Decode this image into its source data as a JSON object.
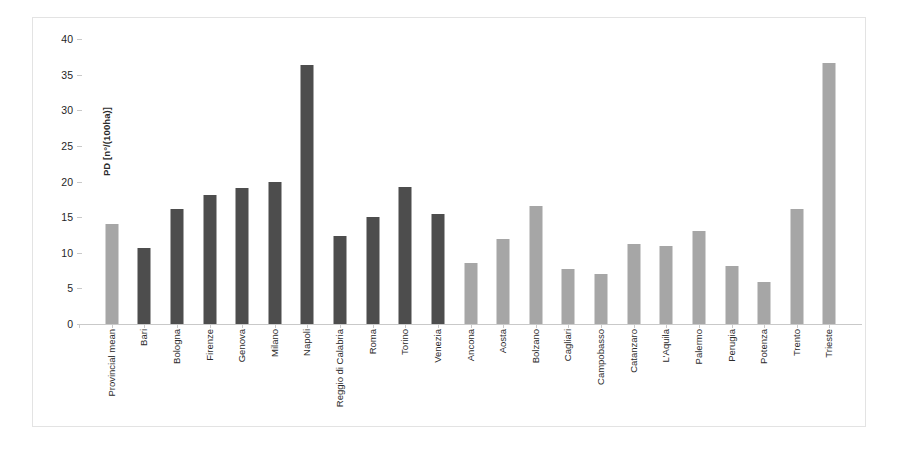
{
  "chart_data": {
    "type": "bar",
    "title": "",
    "xlabel": "",
    "ylabel": "PD [n°/(100ha)]",
    "ylim": [
      0,
      40
    ],
    "ytick_step": 5,
    "ytick_labels": [
      "40",
      "35",
      "30",
      "25",
      "20",
      "15",
      "10",
      "5",
      "0"
    ],
    "yticks": [
      40,
      35,
      30,
      25,
      20,
      15,
      10,
      5,
      0
    ],
    "grid": false,
    "legend": "none",
    "categories": [
      "Provincial mean",
      "Bari",
      "Bologna",
      "Firenze",
      "Genova",
      "Milano",
      "Napoli",
      "Reggio di Calabria",
      "Roma",
      "Torino",
      "Venezia",
      "Ancona",
      "Aosta",
      "Bolzano",
      "Cagliari",
      "Campobasso",
      "Catanzaro",
      "L'Aquila",
      "Palermo",
      "Perugia",
      "Potenza",
      "Trento",
      "Trieste"
    ],
    "values": [
      14.0,
      10.7,
      16.1,
      18.1,
      19.1,
      19.9,
      36.4,
      12.3,
      15.0,
      19.3,
      15.4,
      8.5,
      12.0,
      16.6,
      7.7,
      7.0,
      11.2,
      10.9,
      13.1,
      8.2,
      5.9,
      16.2,
      36.6
    ],
    "bar_colors": [
      "#a6a6a6",
      "#4d4d4d",
      "#4d4d4d",
      "#4d4d4d",
      "#4d4d4d",
      "#4d4d4d",
      "#4d4d4d",
      "#4d4d4d",
      "#4d4d4d",
      "#4d4d4d",
      "#4d4d4d",
      "#a6a6a6",
      "#a6a6a6",
      "#a6a6a6",
      "#a6a6a6",
      "#a6a6a6",
      "#a6a6a6",
      "#a6a6a6",
      "#a6a6a6",
      "#a6a6a6",
      "#a6a6a6",
      "#a6a6a6",
      "#a6a6a6"
    ],
    "colors": {
      "dark_bar": "#4d4d4d",
      "light_bar": "#a6a6a6",
      "axis": "#c9c9c9",
      "text": "#2b2b2b",
      "background": "#ffffff",
      "frame": "#e3e3e3"
    }
  }
}
